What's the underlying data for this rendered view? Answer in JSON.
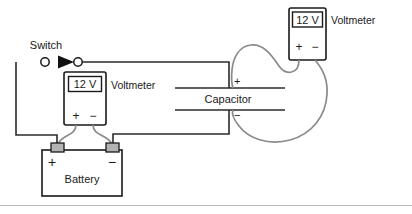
{
  "diagram": {
    "colors": {
      "wire_dark": "#2b2b2b",
      "wire_gray": "#8a8a8a",
      "outline": "#1a1a1a",
      "terminal_fill": "#b3b3b3",
      "background": "#ffffff",
      "divider": "#b8b8b8"
    },
    "switch": {
      "label": "Switch"
    },
    "battery": {
      "label": "Battery",
      "positive_sign": "+",
      "negative_sign": "−"
    },
    "capacitor": {
      "label": "Capacitor",
      "positive_sign": "+",
      "negative_sign": "−"
    },
    "voltmeter_left": {
      "label": "Voltmeter",
      "reading": "12 V",
      "positive_sign": "+",
      "negative_sign": "−"
    },
    "voltmeter_top": {
      "label": "Voltmeter",
      "reading": "12 V",
      "positive_sign": "+",
      "negative_sign": "−"
    }
  }
}
